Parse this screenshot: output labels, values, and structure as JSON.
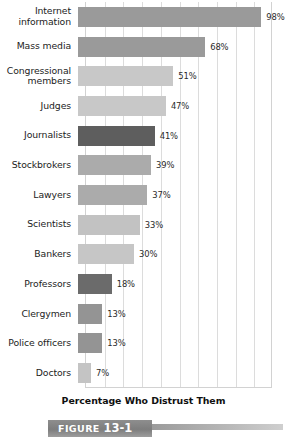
{
  "chart_data": {
    "type": "bar",
    "orientation": "horizontal",
    "title": "",
    "xlabel": "Percentage Who Distrust Them",
    "ylabel": "",
    "xlim": [
      0,
      100
    ],
    "grid": true,
    "gridline_step": 10,
    "legend": "none",
    "categories": [
      "Internet information",
      "Mass media",
      "Congressional members",
      "Judges",
      "Journalists",
      "Stockbrokers",
      "Lawyers",
      "Scientists",
      "Bankers",
      "Professors",
      "Clergymen",
      "Police officers",
      "Doctors"
    ],
    "values": [
      98,
      68,
      51,
      47,
      41,
      39,
      37,
      33,
      30,
      18,
      13,
      13,
      7
    ],
    "value_labels": [
      "98%",
      "68%",
      "51%",
      "47%",
      "41%",
      "39%",
      "37%",
      "33%",
      "30%",
      "18%",
      "13%",
      "13%",
      "7%"
    ],
    "bar_colors": [
      "#9a9a9a",
      "#9a9a9a",
      "#c8c8c8",
      "#c8c8c8",
      "#5e5e5e",
      "#ababab",
      "#ababab",
      "#c2c2c2",
      "#c6c6c6",
      "#6b6b6b",
      "#949494",
      "#949494",
      "#c4c4c4"
    ]
  },
  "rows": [
    {
      "label_line1": "Internet",
      "label_line2": "information",
      "value_label": "98%"
    },
    {
      "label_line1": "Mass media",
      "label_line2": "",
      "value_label": "68%"
    },
    {
      "label_line1": "Congressional",
      "label_line2": "members",
      "value_label": "51%"
    },
    {
      "label_line1": "Judges",
      "label_line2": "",
      "value_label": "47%"
    },
    {
      "label_line1": "Journalists",
      "label_line2": "",
      "value_label": "41%"
    },
    {
      "label_line1": "Stockbrokers",
      "label_line2": "",
      "value_label": "39%"
    },
    {
      "label_line1": "Lawyers",
      "label_line2": "",
      "value_label": "37%"
    },
    {
      "label_line1": "Scientists",
      "label_line2": "",
      "value_label": "33%"
    },
    {
      "label_line1": "Bankers",
      "label_line2": "",
      "value_label": "30%"
    },
    {
      "label_line1": "Professors",
      "label_line2": "",
      "value_label": "18%"
    },
    {
      "label_line1": "Clergymen",
      "label_line2": "",
      "value_label": "13%"
    },
    {
      "label_line1": "Police officers",
      "label_line2": "",
      "value_label": "13%"
    },
    {
      "label_line1": "Doctors",
      "label_line2": "",
      "value_label": "7%"
    }
  ],
  "axis": {
    "title": "Percentage Who Distrust Them"
  },
  "figure": {
    "prefix": "FIGURE",
    "number": "13-1"
  }
}
